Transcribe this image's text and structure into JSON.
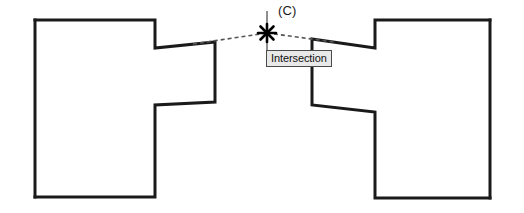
{
  "drawing": {
    "title": "CAD intersection object snap",
    "background_color": "#ffffff",
    "line_color": "#1a1a1a",
    "dashed_line_color": "#555555",
    "marker_color": "#000000"
  },
  "labels": {
    "callout_c": "(C)",
    "osnap_tooltip": "Intersection"
  },
  "tooltip": {
    "text": "Intersection",
    "background_color": "#e8e8e8",
    "border_color": "#4a4a4a",
    "text_color": "#101010",
    "x": 266,
    "y": 50,
    "width": 61,
    "height": 17
  },
  "marker": {
    "name": "intersection-snap-marker",
    "style": "asterisk-star",
    "x": 267,
    "y": 33,
    "radius": 11,
    "crosshair_line": {
      "x": 267,
      "y_top": 11,
      "y_bottom": 58
    }
  },
  "shapes": {
    "left_part": {
      "name": "left-bracket-part",
      "points": "35,20 155,20 155,48 215,42 215,102 155,105 155,197 35,197",
      "stroke_width": 3
    },
    "right_part": {
      "name": "right-bracket-part",
      "points": "490,20 375,20 375,48 312,39 312,105 375,112 375,198 490,198",
      "stroke_width": 3
    }
  },
  "construction_lines": [
    {
      "name": "left-construction-line",
      "x1": 196,
      "y1": 43,
      "x2": 267,
      "y2": 33,
      "dash": "4 3"
    },
    {
      "name": "right-construction-line",
      "x1": 267,
      "y1": 33,
      "x2": 330,
      "y2": 42,
      "dash": "4 3"
    }
  ],
  "chart_data": {
    "type": "table",
    "categories": [
      "left_part",
      "right_part",
      "intersection_point"
    ],
    "values": [
      0,
      0,
      0
    ],
    "annotations": [
      "(C)",
      "Intersection"
    ]
  }
}
